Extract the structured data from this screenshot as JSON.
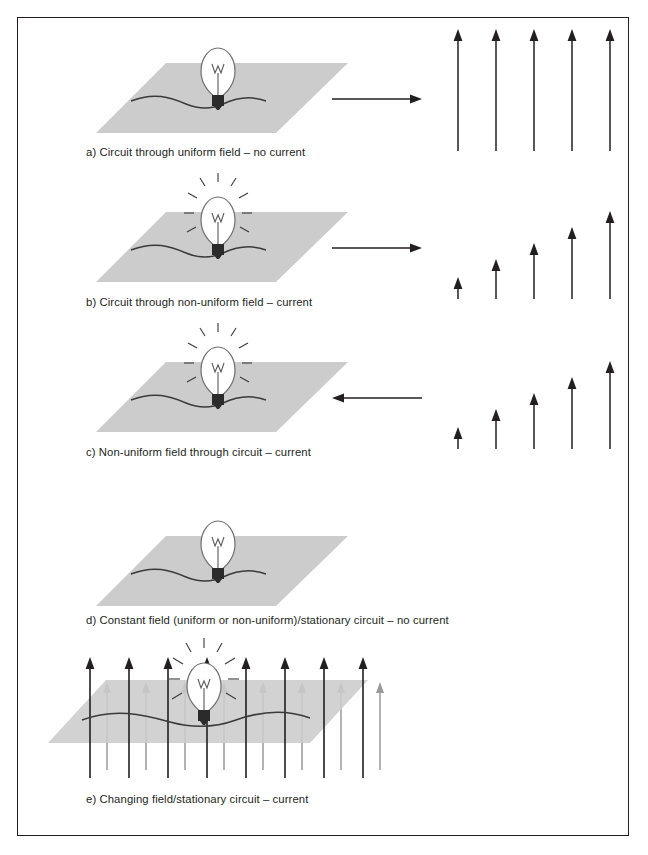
{
  "figure": {
    "border_color": "#231f20",
    "background": "#ffffff",
    "plane_fill": "#cccccc",
    "plane_edge": "#cccccc",
    "wire_color": "#3a3a3a",
    "bulb_glass_color": "#6f6f6f",
    "bulb_base_color": "#2b2b2b",
    "arrow_dark_color": "#231f20",
    "arrow_light_color": "#9a9a9a",
    "motion_arrow_color": "#231f20"
  },
  "panels": [
    {
      "id": "a",
      "caption": "a) Circuit through uniform field – no current",
      "bulb_lit": false,
      "motion_arrow": "right",
      "field_type": "uniform",
      "field_arrow_count": 5,
      "field_arrow_lengths": [
        78,
        78,
        78,
        78,
        78
      ]
    },
    {
      "id": "b",
      "caption": "b) Circuit through non-uniform field – current",
      "bulb_lit": true,
      "motion_arrow": "right",
      "field_type": "non-uniform",
      "field_arrow_count": 5,
      "field_arrow_lengths": [
        22,
        40,
        56,
        72,
        88
      ]
    },
    {
      "id": "c",
      "caption": "c) Non-uniform field through circuit – current",
      "bulb_lit": true,
      "motion_arrow": "left",
      "field_type": "non-uniform",
      "field_arrow_count": 5,
      "field_arrow_lengths": [
        22,
        40,
        56,
        72,
        88
      ]
    },
    {
      "id": "d",
      "caption": "d) Constant field (uniform or non-uniform)/stationary circuit – no current",
      "bulb_lit": false,
      "motion_arrow": "none",
      "field_type": "none",
      "field_arrow_count": 0,
      "field_arrow_lengths": []
    },
    {
      "id": "e",
      "caption": "e) Changing field/stationary circuit – current",
      "bulb_lit": true,
      "motion_arrow": "none",
      "field_type": "changing",
      "field_arrow_count": 16,
      "field_arrow_note": "alternating dark tall and grey short arrows piercing the plane"
    }
  ]
}
